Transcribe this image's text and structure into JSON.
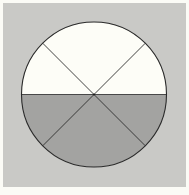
{
  "diagram": {
    "type": "divided-circle",
    "total_sectors": 6,
    "shaded_sectors": 3,
    "unshaded_sectors": 3,
    "shaded_region": "lower half",
    "unshaded_region": "upper half",
    "sectors": [
      {
        "position": "upper-left",
        "angle_deg": 45,
        "shaded": false
      },
      {
        "position": "upper-middle",
        "angle_deg": 90,
        "shaded": false
      },
      {
        "position": "upper-right",
        "angle_deg": 45,
        "shaded": false
      },
      {
        "position": "lower-right",
        "angle_deg": 45,
        "shaded": true
      },
      {
        "position": "lower-middle",
        "angle_deg": 90,
        "shaded": true
      },
      {
        "position": "lower-left",
        "angle_deg": 45,
        "shaded": true
      }
    ],
    "colors": {
      "page_background": "#fbfbf6",
      "frame_background": "#c9c9c6",
      "unshaded_fill": "#fdfdf7",
      "shaded_fill": "#a3a3a1",
      "stroke": "#2e2e2e"
    }
  }
}
